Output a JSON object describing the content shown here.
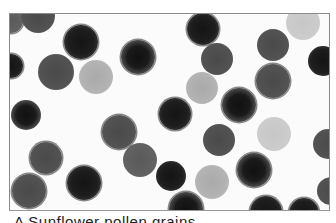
{
  "figure": {
    "grain_count_visible": 30
  },
  "grains": [
    {
      "x": 10,
      "y": 20,
      "r": 12,
      "tone": "g-mid2",
      "spiky": true
    },
    {
      "x": 37,
      "y": 15,
      "r": 17,
      "tone": "g-mid",
      "spiky": false
    },
    {
      "x": 80,
      "y": 41,
      "r": 17,
      "tone": "g-dark",
      "spiky": true
    },
    {
      "x": 10,
      "y": 65,
      "r": 12,
      "tone": "g-dark",
      "spiky": true
    },
    {
      "x": 55,
      "y": 71,
      "r": 18,
      "tone": "g-mid",
      "spiky": false
    },
    {
      "x": 95,
      "y": 76,
      "r": 17,
      "tone": "g-light",
      "spiky": false
    },
    {
      "x": 137,
      "y": 56,
      "r": 17,
      "tone": "g-ring",
      "spiky": true
    },
    {
      "x": 202,
      "y": 28,
      "r": 16,
      "tone": "g-dark",
      "spiky": true
    },
    {
      "x": 216,
      "y": 58,
      "r": 16,
      "tone": "g-mid",
      "spiky": false
    },
    {
      "x": 201,
      "y": 87,
      "r": 16,
      "tone": "g-light",
      "spiky": false
    },
    {
      "x": 272,
      "y": 44,
      "r": 16,
      "tone": "g-mid",
      "spiky": false
    },
    {
      "x": 302,
      "y": 22,
      "r": 17,
      "tone": "g-pale",
      "spiky": false
    },
    {
      "x": 322,
      "y": 60,
      "r": 15,
      "tone": "g-dark",
      "spiky": false
    },
    {
      "x": 272,
      "y": 80,
      "r": 17,
      "tone": "g-mid",
      "spiky": true
    },
    {
      "x": 238,
      "y": 104,
      "r": 17,
      "tone": "g-ring",
      "spiky": true
    },
    {
      "x": 174,
      "y": 113,
      "r": 16,
      "tone": "g-dark",
      "spiky": true
    },
    {
      "x": 25,
      "y": 114,
      "r": 15,
      "tone": "g-ring",
      "spiky": false
    },
    {
      "x": 118,
      "y": 131,
      "r": 17,
      "tone": "g-mid",
      "spiky": true
    },
    {
      "x": 139,
      "y": 159,
      "r": 17,
      "tone": "g-mid2",
      "spiky": false
    },
    {
      "x": 45,
      "y": 157,
      "r": 16,
      "tone": "g-mid",
      "spiky": true
    },
    {
      "x": 218,
      "y": 139,
      "r": 16,
      "tone": "g-mid",
      "spiky": false
    },
    {
      "x": 273,
      "y": 133,
      "r": 17,
      "tone": "g-pale",
      "spiky": false
    },
    {
      "x": 327,
      "y": 143,
      "r": 15,
      "tone": "g-mid",
      "spiky": false
    },
    {
      "x": 170,
      "y": 175,
      "r": 15,
      "tone": "g-dark",
      "spiky": false
    },
    {
      "x": 211,
      "y": 181,
      "r": 17,
      "tone": "g-light",
      "spiky": false
    },
    {
      "x": 253,
      "y": 169,
      "r": 17,
      "tone": "g-ring",
      "spiky": true
    },
    {
      "x": 28,
      "y": 190,
      "r": 17,
      "tone": "g-mid",
      "spiky": true
    },
    {
      "x": 83,
      "y": 182,
      "r": 17,
      "tone": "g-dark",
      "spiky": true
    },
    {
      "x": 185,
      "y": 208,
      "r": 17,
      "tone": "g-ring",
      "spiky": true
    },
    {
      "x": 265,
      "y": 211,
      "r": 16,
      "tone": "g-dark",
      "spiky": true
    },
    {
      "x": 303,
      "y": 212,
      "r": 15,
      "tone": "g-dark",
      "spiky": true
    },
    {
      "x": 330,
      "y": 190,
      "r": 14,
      "tone": "g-mid",
      "spiky": false
    }
  ],
  "caption": {
    "text": "A Sunflower pollen grains"
  }
}
